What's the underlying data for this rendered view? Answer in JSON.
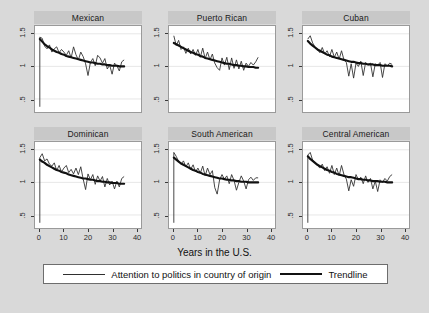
{
  "chart_data": {
    "type": "line",
    "title": "",
    "xlabel": "Years in the U.S.",
    "ylabel": "",
    "xlim": [
      -2,
      42
    ],
    "ylim": [
      0.3,
      1.62
    ],
    "xticks": [
      "0",
      "10",
      "20",
      "30",
      "40"
    ],
    "xtick_values": [
      0,
      10,
      20,
      30,
      40
    ],
    "yticks": [
      "1.5",
      "1",
      ".5"
    ],
    "ytick_values": [
      1.5,
      1,
      0.5
    ],
    "grid": "horizontal",
    "legend_position": "bottom",
    "layout": "2 rows x 3 columns small multiples",
    "legend": [
      {
        "name": "Attention to politics in country of origin",
        "style": "thin-line"
      },
      {
        "name": "Trendline",
        "style": "thick-line"
      }
    ],
    "panels": [
      {
        "title": "Mexican",
        "row": 0,
        "col": 0,
        "x": [
          0,
          1,
          2,
          3,
          4,
          5,
          6,
          7,
          8,
          9,
          10,
          11,
          12,
          13,
          14,
          15,
          16,
          17,
          18,
          19,
          20,
          21,
          22,
          23,
          24,
          25,
          26,
          27,
          28,
          29,
          30,
          31,
          32,
          33,
          34,
          35
        ],
        "series_values": [
          1.45,
          1.43,
          1.31,
          1.27,
          1.33,
          1.22,
          1.27,
          1.3,
          1.21,
          1.26,
          1.22,
          1.17,
          1.24,
          1.13,
          1.3,
          1.18,
          1.1,
          1.22,
          1.15,
          1.04,
          0.86,
          1.06,
          1.12,
          1.01,
          1.17,
          1.13,
          1.05,
          1.12,
          0.96,
          1.02,
          0.88,
          1.05,
          1.01,
          0.93,
          1.07,
          1.1
        ],
        "trend_values": [
          1.42,
          1.38,
          1.34,
          1.31,
          1.29,
          1.26,
          1.24,
          1.22,
          1.21,
          1.19,
          1.18,
          1.16,
          1.15,
          1.14,
          1.13,
          1.12,
          1.11,
          1.1,
          1.09,
          1.08,
          1.07,
          1.06,
          1.06,
          1.05,
          1.04,
          1.04,
          1.03,
          1.03,
          1.02,
          1.02,
          1.01,
          1.01,
          1.01,
          1.0,
          1.0,
          1.0
        ],
        "baseline_drop": 0.38
      },
      {
        "title": "Puerto Rican",
        "row": 0,
        "col": 1,
        "x": [
          0,
          1,
          2,
          3,
          4,
          5,
          6,
          7,
          8,
          9,
          10,
          11,
          12,
          13,
          14,
          15,
          16,
          17,
          18,
          19,
          20,
          21,
          22,
          23,
          24,
          25,
          26,
          27,
          28,
          29,
          30,
          31,
          32,
          33,
          34,
          35
        ],
        "series_values": [
          1.47,
          1.32,
          1.4,
          1.26,
          1.3,
          1.2,
          1.28,
          1.19,
          1.26,
          1.17,
          1.26,
          1.14,
          1.28,
          1.12,
          1.22,
          1.1,
          1.19,
          1.05,
          0.98,
          0.94,
          1.13,
          1.02,
          1.14,
          0.95,
          1.13,
          0.97,
          1.1,
          0.96,
          1.08,
          0.94,
          1.05,
          1.0,
          1.06,
          1.02,
          1.07,
          1.14
        ],
        "trend_values": [
          1.36,
          1.34,
          1.32,
          1.3,
          1.28,
          1.26,
          1.24,
          1.22,
          1.21,
          1.19,
          1.18,
          1.16,
          1.15,
          1.13,
          1.12,
          1.11,
          1.1,
          1.09,
          1.08,
          1.07,
          1.06,
          1.05,
          1.04,
          1.04,
          1.03,
          1.02,
          1.02,
          1.01,
          1.01,
          1.0,
          1.0,
          0.99,
          0.99,
          0.99,
          0.98,
          0.98
        ],
        "baseline_drop": null
      },
      {
        "title": "Cuban",
        "row": 0,
        "col": 2,
        "x": [
          0,
          1,
          2,
          3,
          4,
          5,
          6,
          7,
          8,
          9,
          10,
          11,
          12,
          13,
          14,
          15,
          16,
          17,
          18,
          19,
          20,
          21,
          22,
          23,
          24,
          25,
          26,
          27,
          28,
          29,
          30,
          31,
          32,
          33,
          34,
          35
        ],
        "series_values": [
          1.42,
          1.47,
          1.36,
          1.3,
          1.26,
          1.21,
          1.29,
          1.19,
          1.24,
          1.15,
          1.26,
          1.14,
          1.22,
          1.11,
          1.24,
          1.1,
          1.06,
          0.85,
          1.04,
          0.82,
          1.05,
          1.0,
          1.08,
          0.86,
          1.06,
          1.02,
          1.05,
          0.84,
          1.04,
          1.02,
          1.06,
          0.83,
          1.04,
          1.01,
          1.05,
          1.03
        ],
        "trend_values": [
          1.39,
          1.35,
          1.32,
          1.29,
          1.26,
          1.24,
          1.22,
          1.2,
          1.18,
          1.17,
          1.15,
          1.14,
          1.13,
          1.12,
          1.11,
          1.1,
          1.09,
          1.08,
          1.07,
          1.07,
          1.06,
          1.05,
          1.05,
          1.04,
          1.04,
          1.03,
          1.03,
          1.03,
          1.02,
          1.02,
          1.02,
          1.01,
          1.01,
          1.01,
          1.01,
          1.0
        ],
        "baseline_drop": null
      },
      {
        "title": "Dominican",
        "row": 1,
        "col": 0,
        "x": [
          0,
          1,
          2,
          3,
          4,
          5,
          6,
          7,
          8,
          9,
          10,
          11,
          12,
          13,
          14,
          15,
          16,
          17,
          18,
          19,
          20,
          21,
          22,
          23,
          24,
          25,
          26,
          27,
          28,
          29,
          30,
          31,
          32,
          33,
          34,
          35
        ],
        "series_values": [
          1.38,
          1.44,
          1.33,
          1.36,
          1.28,
          1.25,
          1.3,
          1.18,
          1.26,
          1.16,
          1.22,
          1.26,
          1.15,
          1.2,
          1.13,
          1.22,
          1.12,
          1.24,
          1.05,
          0.89,
          1.13,
          1.04,
          1.12,
          0.97,
          1.1,
          1.02,
          1.09,
          0.93,
          1.06,
          0.96,
          1.02,
          0.9,
          1.02,
          0.93,
          1.06,
          1.09
        ],
        "trend_values": [
          1.35,
          1.32,
          1.3,
          1.27,
          1.25,
          1.23,
          1.21,
          1.19,
          1.18,
          1.16,
          1.15,
          1.14,
          1.12,
          1.11,
          1.1,
          1.09,
          1.08,
          1.07,
          1.06,
          1.06,
          1.05,
          1.04,
          1.04,
          1.03,
          1.02,
          1.02,
          1.01,
          1.01,
          1.0,
          1.0,
          0.99,
          0.99,
          0.99,
          0.98,
          0.98,
          0.98
        ],
        "baseline_drop": 0.38
      },
      {
        "title": "South American",
        "row": 1,
        "col": 1,
        "x": [
          0,
          1,
          2,
          3,
          4,
          5,
          6,
          7,
          8,
          9,
          10,
          11,
          12,
          13,
          14,
          15,
          16,
          17,
          18,
          19,
          20,
          21,
          22,
          23,
          24,
          25,
          26,
          27,
          28,
          29,
          30,
          31,
          32,
          33,
          34,
          35
        ],
        "series_values": [
          1.46,
          1.4,
          1.32,
          1.28,
          1.33,
          1.24,
          1.3,
          1.2,
          1.27,
          1.16,
          1.22,
          1.14,
          1.25,
          1.1,
          1.22,
          1.12,
          1.18,
          0.92,
          0.82,
          1.04,
          1.12,
          1.05,
          1.1,
          0.98,
          1.12,
          1.03,
          0.88,
          1.0,
          1.1,
          1.02,
          0.9,
          1.04,
          1.08,
          1.03,
          1.07,
          1.07
        ],
        "trend_values": [
          1.38,
          1.35,
          1.32,
          1.29,
          1.27,
          1.25,
          1.23,
          1.21,
          1.19,
          1.18,
          1.16,
          1.15,
          1.13,
          1.12,
          1.11,
          1.1,
          1.09,
          1.08,
          1.07,
          1.06,
          1.06,
          1.05,
          1.04,
          1.04,
          1.03,
          1.03,
          1.02,
          1.02,
          1.01,
          1.01,
          1.01,
          1.0,
          1.0,
          1.0,
          1.0,
          1.0
        ],
        "baseline_drop": 0.38
      },
      {
        "title": "Central American",
        "row": 1,
        "col": 2,
        "x": [
          0,
          1,
          2,
          3,
          4,
          5,
          6,
          7,
          8,
          9,
          10,
          11,
          12,
          13,
          14,
          15,
          16,
          17,
          18,
          19,
          20,
          21,
          22,
          23,
          24,
          25,
          26,
          27,
          28,
          29,
          30,
          31,
          32,
          33,
          34,
          35
        ],
        "series_values": [
          1.42,
          1.46,
          1.34,
          1.3,
          1.26,
          1.22,
          1.28,
          1.18,
          1.24,
          1.14,
          1.26,
          1.12,
          1.22,
          1.1,
          1.26,
          1.12,
          1.05,
          0.87,
          1.04,
          0.94,
          1.12,
          1.04,
          1.08,
          0.98,
          1.1,
          1.0,
          1.06,
          0.9,
          1.02,
          0.86,
          1.04,
          1.0,
          1.06,
          1.02,
          1.09,
          1.12
        ],
        "trend_values": [
          1.4,
          1.36,
          1.33,
          1.3,
          1.27,
          1.25,
          1.23,
          1.21,
          1.19,
          1.18,
          1.16,
          1.15,
          1.13,
          1.12,
          1.11,
          1.1,
          1.09,
          1.08,
          1.08,
          1.07,
          1.06,
          1.05,
          1.05,
          1.04,
          1.04,
          1.03,
          1.03,
          1.02,
          1.02,
          1.02,
          1.01,
          1.01,
          1.01,
          1.0,
          1.0,
          1.0
        ],
        "baseline_drop": 0.38
      }
    ]
  },
  "colors": {
    "page_background": "#d9d9d9",
    "panel_strip": "#c8c8c8",
    "plot_background": "#ffffff",
    "series_line": "#2f2f2f",
    "trend_line": "#111111",
    "axis": "#3a3a3a",
    "gridline": "#e6e6e6"
  }
}
